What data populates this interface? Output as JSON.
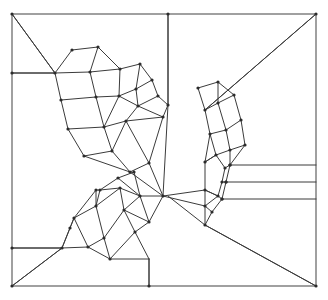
{
  "diagram": {
    "kind": "planar-graph",
    "canvas": {
      "width": 328,
      "height": 300
    },
    "colors": {
      "background": "#ffffff",
      "edge": "#3b3b3b",
      "frame": "#6e6e6e",
      "vertex": "#2b2b2b"
    },
    "style": {
      "edge_width": 1,
      "frame_width": 1.3,
      "vertex_radius": 1.6
    },
    "frame": {
      "name": "outer-rectangle",
      "x": 12,
      "y": 14,
      "width": 304,
      "height": 272,
      "points": "12,14 316,14 316,286 12,286"
    },
    "corner_diagonals": [
      {
        "name": "top-left-diagonal",
        "x1": 12,
        "y1": 14,
        "x2": 55,
        "y2": 73
      },
      {
        "name": "top-right-diagonal",
        "x1": 316,
        "y1": 14,
        "x2": 205,
        "y2": 110
      },
      {
        "name": "bottom-left-diagonal",
        "x1": 12,
        "y1": 286,
        "x2": 62,
        "y2": 248
      },
      {
        "name": "bottom-right-diagonal",
        "x1": 316,
        "y1": 286,
        "x2": 205,
        "y2": 225
      }
    ],
    "border_stubs": [
      {
        "name": "left-stub-upper",
        "x1": 12,
        "y1": 73,
        "x2": 55,
        "y2": 73
      },
      {
        "name": "left-stub-lower",
        "x1": 12,
        "y1": 248,
        "x2": 62,
        "y2": 248
      },
      {
        "name": "top-stub-middle",
        "x1": 168,
        "y1": 14,
        "x2": 168,
        "y2": 105
      },
      {
        "name": "bottom-stub-middle",
        "x1": 149,
        "y1": 286,
        "x2": 149,
        "y2": 259
      }
    ],
    "right_horizontals": [
      {
        "name": "right-horizontal-1",
        "x1": 230,
        "y1": 165,
        "x2": 316,
        "y2": 165
      },
      {
        "name": "right-horizontal-2",
        "x1": 226,
        "y1": 182,
        "x2": 316,
        "y2": 182
      },
      {
        "name": "right-horizontal-3",
        "x1": 222,
        "y1": 199,
        "x2": 316,
        "y2": 199
      }
    ],
    "chains": [
      {
        "name": "upper-chain",
        "cell_count": 13,
        "span": "left border to right cluster"
      },
      {
        "name": "lower-chain",
        "cell_count": 12,
        "span": "left border to right cluster"
      }
    ],
    "edges": [
      [
        12,
        14,
        316,
        14
      ],
      [
        316,
        14,
        316,
        286
      ],
      [
        316,
        286,
        12,
        286
      ],
      [
        12,
        286,
        12,
        14
      ],
      [
        12,
        14,
        55,
        73
      ],
      [
        12,
        73,
        55,
        73
      ],
      [
        316,
        14,
        205,
        110
      ],
      [
        12,
        286,
        62,
        248
      ],
      [
        12,
        248,
        62,
        248
      ],
      [
        316,
        286,
        205,
        225
      ],
      [
        205,
        225,
        168,
        196
      ],
      [
        168,
        14,
        168,
        105
      ],
      [
        168,
        105,
        163,
        196
      ],
      [
        149,
        286,
        149,
        259
      ],
      [
        55,
        73,
        61,
        100
      ],
      [
        55,
        73,
        72,
        50
      ],
      [
        72,
        50,
        98,
        47
      ],
      [
        98,
        47,
        90,
        72
      ],
      [
        55,
        73,
        90,
        72
      ],
      [
        90,
        72,
        96,
        97
      ],
      [
        61,
        100,
        96,
        97
      ],
      [
        61,
        100,
        68,
        129
      ],
      [
        96,
        97,
        104,
        127
      ],
      [
        68,
        129,
        104,
        127
      ],
      [
        98,
        47,
        120,
        69
      ],
      [
        90,
        72,
        120,
        69
      ],
      [
        120,
        69,
        119,
        96
      ],
      [
        96,
        97,
        119,
        96
      ],
      [
        119,
        96,
        104,
        127
      ],
      [
        120,
        69,
        140,
        64
      ],
      [
        140,
        64,
        136,
        89
      ],
      [
        119,
        96,
        136,
        89
      ],
      [
        136,
        89,
        138,
        106
      ],
      [
        119,
        96,
        138,
        106
      ],
      [
        138,
        106,
        126,
        121
      ],
      [
        104,
        127,
        126,
        121
      ],
      [
        140,
        64,
        152,
        80
      ],
      [
        152,
        80,
        136,
        89
      ],
      [
        152,
        80,
        158,
        96
      ],
      [
        138,
        106,
        158,
        96
      ],
      [
        158,
        96,
        168,
        105
      ],
      [
        138,
        106,
        163,
        117
      ],
      [
        163,
        117,
        168,
        105
      ],
      [
        126,
        121,
        163,
        117
      ],
      [
        68,
        129,
        84,
        156
      ],
      [
        104,
        127,
        112,
        151
      ],
      [
        84,
        156,
        112,
        151
      ],
      [
        112,
        151,
        126,
        121
      ],
      [
        84,
        156,
        130,
        172
      ],
      [
        112,
        151,
        130,
        172
      ],
      [
        130,
        172,
        149,
        163
      ],
      [
        126,
        121,
        149,
        163
      ],
      [
        149,
        163,
        163,
        117
      ],
      [
        149,
        163,
        163,
        196
      ],
      [
        130,
        172,
        163,
        196
      ],
      [
        205,
        110,
        198,
        88
      ],
      [
        198,
        88,
        218,
        82
      ],
      [
        205,
        110,
        218,
        103
      ],
      [
        218,
        82,
        218,
        103
      ],
      [
        218,
        82,
        234,
        95
      ],
      [
        218,
        103,
        234,
        95
      ],
      [
        205,
        110,
        210,
        134
      ],
      [
        218,
        103,
        226,
        130
      ],
      [
        210,
        134,
        226,
        130
      ],
      [
        234,
        95,
        241,
        120
      ],
      [
        226,
        130,
        241,
        120
      ],
      [
        210,
        134,
        216,
        155
      ],
      [
        226,
        130,
        230,
        150
      ],
      [
        216,
        155,
        230,
        150
      ],
      [
        241,
        120,
        245,
        145
      ],
      [
        230,
        150,
        245,
        145
      ],
      [
        216,
        155,
        225,
        168
      ],
      [
        230,
        150,
        230,
        165
      ],
      [
        225,
        168,
        230,
        165
      ],
      [
        230,
        165,
        245,
        145
      ],
      [
        225,
        168,
        222,
        182
      ],
      [
        230,
        165,
        226,
        182
      ],
      [
        222,
        182,
        226,
        182
      ],
      [
        216,
        155,
        205,
        162
      ],
      [
        205,
        162,
        216,
        155
      ],
      [
        205,
        162,
        210,
        134
      ],
      [
        222,
        182,
        218,
        196
      ],
      [
        226,
        182,
        222,
        199
      ],
      [
        218,
        196,
        222,
        199
      ],
      [
        218,
        196,
        205,
        190
      ],
      [
        205,
        190,
        205,
        162
      ],
      [
        205,
        190,
        218,
        196
      ],
      [
        222,
        199,
        212,
        212
      ],
      [
        218,
        196,
        205,
        206
      ],
      [
        205,
        206,
        212,
        212
      ],
      [
        205,
        190,
        205,
        206
      ],
      [
        205,
        206,
        205,
        225
      ],
      [
        212,
        212,
        205,
        225
      ],
      [
        163,
        196,
        205,
        190
      ],
      [
        163,
        196,
        205,
        206
      ],
      [
        62,
        248,
        74,
        218
      ],
      [
        62,
        248,
        88,
        247
      ],
      [
        74,
        218,
        88,
        247
      ],
      [
        74,
        218,
        96,
        206
      ],
      [
        88,
        247,
        104,
        238
      ],
      [
        96,
        206,
        104,
        238
      ],
      [
        96,
        206,
        100,
        190
      ],
      [
        100,
        190,
        120,
        188
      ],
      [
        96,
        206,
        120,
        188
      ],
      [
        120,
        188,
        124,
        210
      ],
      [
        104,
        238,
        124,
        210
      ],
      [
        120,
        188,
        140,
        196
      ],
      [
        124,
        210,
        140,
        196
      ],
      [
        88,
        247,
        110,
        259
      ],
      [
        104,
        238,
        110,
        259
      ],
      [
        110,
        259,
        149,
        259
      ],
      [
        124,
        210,
        135,
        232
      ],
      [
        110,
        259,
        135,
        232
      ],
      [
        135,
        232,
        149,
        259
      ],
      [
        135,
        232,
        149,
        222
      ],
      [
        124,
        210,
        149,
        222
      ],
      [
        149,
        222,
        140,
        196
      ],
      [
        140,
        196,
        163,
        196
      ],
      [
        149,
        222,
        163,
        196
      ],
      [
        100,
        190,
        118,
        178
      ],
      [
        118,
        178,
        140,
        196
      ],
      [
        118,
        178,
        134,
        172
      ],
      [
        134,
        172,
        140,
        196
      ],
      [
        74,
        218,
        96,
        190
      ],
      [
        96,
        190,
        100,
        190
      ],
      [
        96,
        190,
        96,
        206
      ],
      [
        62,
        248,
        70,
        228
      ],
      [
        70,
        228,
        74,
        218
      ]
    ],
    "vertices": [
      [
        12,
        14
      ],
      [
        316,
        14
      ],
      [
        316,
        286
      ],
      [
        12,
        286
      ],
      [
        12,
        73
      ],
      [
        12,
        248
      ],
      [
        168,
        14
      ],
      [
        149,
        286
      ],
      [
        55,
        73
      ],
      [
        72,
        50
      ],
      [
        98,
        47
      ],
      [
        90,
        72
      ],
      [
        61,
        100
      ],
      [
        96,
        97
      ],
      [
        68,
        129
      ],
      [
        104,
        127
      ],
      [
        120,
        69
      ],
      [
        119,
        96
      ],
      [
        140,
        64
      ],
      [
        136,
        89
      ],
      [
        138,
        106
      ],
      [
        126,
        121
      ],
      [
        152,
        80
      ],
      [
        158,
        96
      ],
      [
        163,
        117
      ],
      [
        168,
        105
      ],
      [
        84,
        156
      ],
      [
        112,
        151
      ],
      [
        130,
        172
      ],
      [
        149,
        163
      ],
      [
        163,
        196
      ],
      [
        205,
        110
      ],
      [
        198,
        88
      ],
      [
        218,
        82
      ],
      [
        218,
        103
      ],
      [
        234,
        95
      ],
      [
        210,
        134
      ],
      [
        226,
        130
      ],
      [
        241,
        120
      ],
      [
        216,
        155
      ],
      [
        230,
        150
      ],
      [
        245,
        145
      ],
      [
        225,
        168
      ],
      [
        230,
        165
      ],
      [
        222,
        182
      ],
      [
        226,
        182
      ],
      [
        205,
        162
      ],
      [
        218,
        196
      ],
      [
        222,
        199
      ],
      [
        205,
        190
      ],
      [
        212,
        212
      ],
      [
        205,
        206
      ],
      [
        205,
        225
      ],
      [
        62,
        248
      ],
      [
        74,
        218
      ],
      [
        88,
        247
      ],
      [
        96,
        206
      ],
      [
        104,
        238
      ],
      [
        100,
        190
      ],
      [
        120,
        188
      ],
      [
        124,
        210
      ],
      [
        140,
        196
      ],
      [
        110,
        259
      ],
      [
        135,
        232
      ],
      [
        149,
        222
      ],
      [
        118,
        178
      ],
      [
        134,
        172
      ],
      [
        96,
        190
      ],
      [
        70,
        228
      ],
      [
        230,
        165
      ],
      [
        226,
        182
      ],
      [
        222,
        199
      ]
    ]
  }
}
